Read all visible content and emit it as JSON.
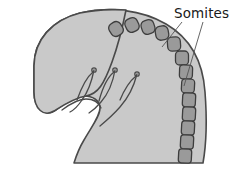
{
  "figure": {
    "type": "anatomical-line-diagram",
    "canvas": {
      "width": 244,
      "height": 180,
      "background": "#ffffff"
    }
  },
  "labels": [
    {
      "id": "somites",
      "text": "Somites",
      "x": 174,
      "y": 7,
      "color": "#1a1a1a",
      "font_size": 13.5,
      "leader_lines": 2
    }
  ],
  "colors": {
    "background": "#ffffff",
    "body_fill": "#c9c9c9",
    "body_stroke": "#4a4a4a",
    "somite_fill": "#9a9a9a",
    "somite_stroke": "#3d3d3d",
    "arch_stroke": "#4a4a4a",
    "leader_stroke": "#555555",
    "label_text": "#1a1a1a"
  },
  "body": {
    "name": "embryo-body",
    "fill": "#c9c9c9",
    "stroke": "#4a4a4a",
    "stroke_width": 1.6,
    "outline_path": "M 34 66 C 34 40 52 20 80 13 C 110 6 142 10 166 24 C 190 38 203 62 205 92 C 207 118 206 146 203 163 L 74 163 C 74 163 78 150 84 140 C 92 126 100 116 100 108 C 100 100 92 96 84 96 C 74 96 64 104 56 110 C 46 117 34 110 34 92 Z"
  },
  "head_lobe": {
    "name": "head-lobe",
    "fill": "#c9c9c9",
    "stroke": "#4a4a4a",
    "stroke_width": 1.6,
    "outline_path": "M 34 66 C 34 40 52 20 80 13 C 104 8 126 10 126 10 C 126 10 120 40 112 62 C 104 84 98 94 86 96 C 74 98 62 106 54 111 C 44 117 34 110 34 92 Z"
  },
  "somites": {
    "name": "somite-chain",
    "count": 13,
    "fill": "#9a9a9a",
    "stroke": "#3d3d3d",
    "stroke_width": 1.3,
    "blocks": [
      {
        "index": 1,
        "cx": 116,
        "cy": 29,
        "w": 13,
        "h": 14,
        "r": 5,
        "rot": -34
      },
      {
        "index": 2,
        "cx": 132,
        "cy": 25,
        "w": 13,
        "h": 14,
        "r": 5,
        "rot": -26
      },
      {
        "index": 3,
        "cx": 148,
        "cy": 27,
        "w": 13,
        "h": 14,
        "r": 5,
        "rot": -18
      },
      {
        "index": 4,
        "cx": 162,
        "cy": 33,
        "w": 13,
        "h": 14,
        "r": 5,
        "rot": -10
      },
      {
        "index": 5,
        "cx": 174,
        "cy": 44,
        "w": 13,
        "h": 14,
        "r": 4.5,
        "rot": -4
      },
      {
        "index": 6,
        "cx": 182,
        "cy": 58,
        "w": 13,
        "h": 14,
        "r": 4,
        "rot": 0
      },
      {
        "index": 7,
        "cx": 186,
        "cy": 72,
        "w": 13,
        "h": 14,
        "r": 3.5,
        "rot": 2
      },
      {
        "index": 8,
        "cx": 188,
        "cy": 86,
        "w": 13,
        "h": 14,
        "r": 3.5,
        "rot": 3
      },
      {
        "index": 9,
        "cx": 189,
        "cy": 100,
        "w": 13,
        "h": 14,
        "r": 3,
        "rot": 3
      },
      {
        "index": 10,
        "cx": 189,
        "cy": 114,
        "w": 13,
        "h": 14,
        "r": 3,
        "rot": 3
      },
      {
        "index": 11,
        "cx": 188,
        "cy": 128,
        "w": 13,
        "h": 14,
        "r": 3,
        "rot": 3
      },
      {
        "index": 12,
        "cx": 187,
        "cy": 142,
        "w": 13,
        "h": 14,
        "r": 3,
        "rot": 3
      },
      {
        "index": 13,
        "cx": 185,
        "cy": 156,
        "w": 13,
        "h": 14,
        "r": 3,
        "rot": 3
      }
    ]
  },
  "pharyngeal_arches": {
    "name": "pharyngeal-arch-loops",
    "count": 3,
    "stroke": "#4a4a4a",
    "stroke_width": 1.3,
    "tip_radius": 2.2,
    "loops": [
      {
        "index": 1,
        "path": "M 77 100 C 82 86 88 76 93 72",
        "tip_x": 94,
        "tip_y": 70
      },
      {
        "index": 2,
        "path": "M 99 101 C 103 86 109 76 114 72",
        "tip_x": 115,
        "tip_y": 70
      },
      {
        "index": 3,
        "path": "M 120 100 C 125 88 131 80 136 76",
        "tip_x": 137,
        "tip_y": 74
      }
    ],
    "descenders": [
      {
        "index": 1,
        "path": "M 94 70 C 92 80 88 92 82 100 C 78 106 74 110 70 112"
      },
      {
        "index": 2,
        "path": "M 115 70 C 113 82 108 94 101 102 C 96 108 92 111 89 113"
      },
      {
        "index": 3,
        "path": "M 137 74 C 134 86 128 98 120 107 C 113 115 106 121 100 126"
      }
    ],
    "base_path": "M 62 110 C 70 104 78 99 86 99 C 94 99 99 103 101 108"
  },
  "leader_lines": {
    "name": "label-leader-lines",
    "stroke": "#555555",
    "stroke_width": 0.9,
    "lines": [
      {
        "index": 1,
        "x1": 182,
        "y1": 22,
        "x2": 162,
        "y2": 47
      },
      {
        "index": 2,
        "x1": 203,
        "y1": 22,
        "x2": 184,
        "y2": 86
      }
    ]
  }
}
